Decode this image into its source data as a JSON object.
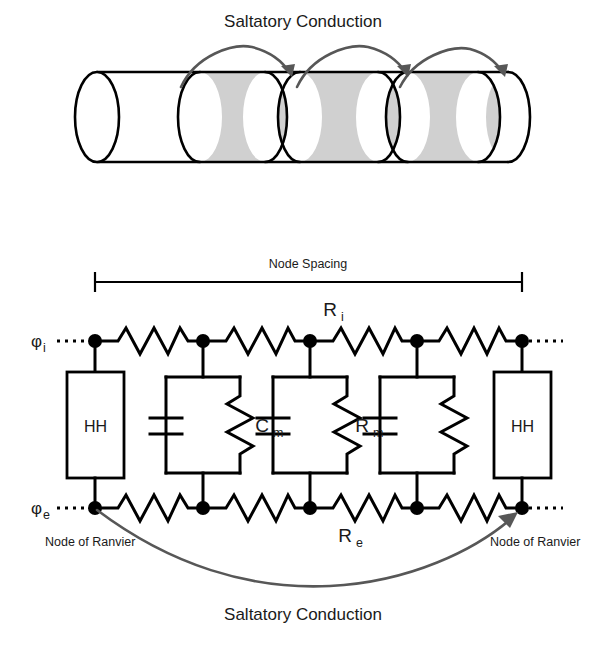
{
  "figure": {
    "title_top": "Saltatory Conduction",
    "title_bottom": "Saltatory Conduction"
  },
  "axon_panel": {
    "caption": "Saltatory Conduction",
    "myelin_color": "#d0d0d0",
    "node_color": "#ffffff",
    "outline_color": "#000000",
    "arrow_color": "#575757",
    "jump_arcs": 3,
    "myelin_segments": 3,
    "node_segments": 4
  },
  "circuit_panel": {
    "node_spacing_label": "Node Spacing",
    "intracellular_potential": {
      "symbol": "φ",
      "subscript": "i"
    },
    "extracellular_potential": {
      "symbol": "φ",
      "subscript": "e"
    },
    "axial_resistance": {
      "symbol": "R",
      "subscript": "i"
    },
    "extracellular_resistance": {
      "symbol": "R",
      "subscript": "e"
    },
    "membrane_capacitance": {
      "symbol": "C",
      "subscript": "m"
    },
    "membrane_resistance": {
      "symbol": "R",
      "subscript": "m"
    },
    "hh_blocks": [
      {
        "label": "HH"
      },
      {
        "label": "HH"
      }
    ],
    "node_labels": [
      "Node of Ranvier",
      "Node of Ranvier"
    ],
    "caption": "Saltatory Conduction",
    "node_count": 5,
    "rc_branch_count": 3,
    "wire_color": "#000000",
    "arrow_color": "#575757"
  }
}
